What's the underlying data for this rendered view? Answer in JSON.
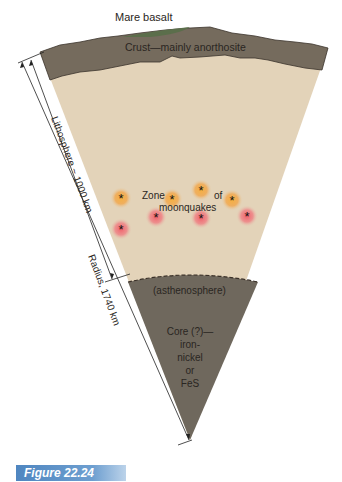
{
  "labels": {
    "mare": "Mare basalt",
    "crust": "Crust—mainly anorthosite",
    "zone1": "Zone",
    "zone2": "of",
    "zone3": "moonquakes",
    "astheno": "(asthenosphere)",
    "core1": "Core (?)—",
    "core2": "iron-",
    "core3": "nickel",
    "core4": "or",
    "core5": "FeS",
    "litho": "Lithosphere  ~ 1000 km",
    "radius": "Radius, 1740 km"
  },
  "caption": "Figure 22.24",
  "colors": {
    "crust": "#756b5d",
    "mantle": "#e3d3b9",
    "core": "#6f685d",
    "mare": "#5b6e4b",
    "caption_bg": "#5a8cc4"
  },
  "moonquakes": [
    {
      "x": 121,
      "y": 198,
      "c": "#f0a030"
    },
    {
      "x": 172,
      "y": 199,
      "c": "#f0a030"
    },
    {
      "x": 201,
      "y": 190,
      "c": "#ee8a3a"
    },
    {
      "x": 232,
      "y": 200,
      "c": "#f0a030"
    },
    {
      "x": 121,
      "y": 229,
      "c": "#ef5a5a"
    },
    {
      "x": 156,
      "y": 217,
      "c": "#ef5a5a"
    },
    {
      "x": 201,
      "y": 218,
      "c": "#ef5a5a"
    },
    {
      "x": 247,
      "y": 216,
      "c": "#ef5a5a"
    }
  ]
}
